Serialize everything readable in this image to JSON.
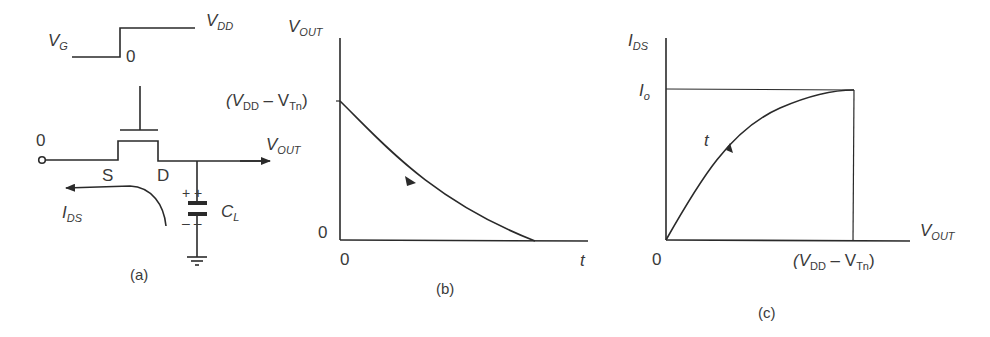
{
  "panel_a": {
    "caption": "(a)",
    "vg_label": "V",
    "vg_sub": "G",
    "vdd_label": "V",
    "vdd_sub": "DD",
    "step_zero": "0",
    "input_zero": "0",
    "source_label": "S",
    "drain_label": "D",
    "vout_label": "V",
    "vout_sub": "OUT",
    "ids_label": "I",
    "ids_sub": "DS",
    "cl_label": "C",
    "cl_sub": "L",
    "cap_plus": "+ +",
    "cap_minus": "– –"
  },
  "panel_b": {
    "caption": "(b)",
    "y_axis_label": "V",
    "y_axis_sub": "OUT",
    "y_tick_open": "(V",
    "y_tick_sub1": "DD",
    "y_tick_mid": " – V",
    "y_tick_sub2": "Tn",
    "y_tick_close": ")",
    "y_zero": "0",
    "x_zero": "0",
    "x_axis_label": "t"
  },
  "panel_c": {
    "caption": "(c)",
    "y_axis_label": "I",
    "y_axis_sub": "DS",
    "io_label": "I",
    "io_sub": "o",
    "curve_label": "t",
    "x_axis_label": "V",
    "x_axis_sub": "OUT",
    "x_zero": "0",
    "x_tick_open": "(V",
    "x_tick_sub1": "DD",
    "x_tick_mid": " – V",
    "x_tick_sub2": "Tn",
    "x_tick_close": ")"
  }
}
